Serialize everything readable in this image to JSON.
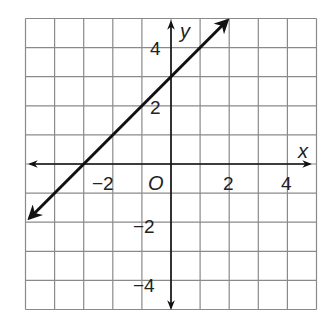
{
  "chart_data": {
    "type": "line",
    "title": "",
    "xlabel": "x",
    "ylabel": "y",
    "origin_label": "O",
    "xlim": [
      -5,
      5
    ],
    "ylim": [
      -5,
      5
    ],
    "grid": true,
    "grid_step": 1,
    "x_ticks": [
      -2,
      2,
      4
    ],
    "x_tick_labels": [
      "−2",
      "2",
      "4"
    ],
    "y_ticks": [
      4,
      2,
      -2,
      -4
    ],
    "y_tick_labels": [
      "4",
      "2",
      "−2",
      "−4"
    ],
    "series": [
      {
        "name": "y = x + 3",
        "equation": "y = x + 3",
        "slope": 1,
        "intercept": 3,
        "x": [
          -5,
          -3,
          0,
          2
        ],
        "y": [
          -2,
          0,
          3,
          5
        ],
        "arrows_both_ends": true,
        "color": "#111111"
      }
    ]
  }
}
